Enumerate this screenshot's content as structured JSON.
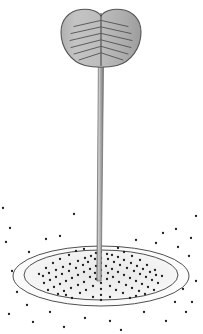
{
  "figure": {
    "canvas": {
      "width": 203,
      "height": 334,
      "background": "#ffffff"
    },
    "palette": {
      "blade_fill_light": "#c2c2c2",
      "blade_fill_dark": "#9d9d9d",
      "blade_outline": "#555555",
      "vein_color": "#4a4a4a",
      "stem_light": "#bdbdbd",
      "stem_mid": "#9a9a9a",
      "stem_dark": "#6f6f6f",
      "stem_outline": "#6a6a6a",
      "ellipse_outline": "#4f4f4f",
      "ellipse_fill_center": "#ededed",
      "ellipse_fill_edge": "#f7f7f7",
      "dot_color": "#1d1d1d"
    }
  },
  "blade": {
    "label": "cordate-leaf-blade",
    "center_x": 101,
    "center_y": 38,
    "radius_x": 40,
    "radius_y": 29,
    "notch_depth": 7,
    "outline_width": 1.1,
    "vein_count": 6,
    "vein_label": "chevron-veins"
  },
  "midrib": {
    "label": "midrib",
    "x": 101,
    "top_y": 13,
    "bottom_y": 66
  },
  "stem": {
    "label": "petiole-stem",
    "top_x": 101,
    "top_y": 60,
    "bottom_x": 99,
    "bottom_y": 281,
    "top_half_width": 2.6,
    "bottom_half_width": 2.2
  },
  "ground": {
    "outer_ellipse": {
      "label": "outer-ellipse",
      "cx": 101,
      "cy": 276,
      "rx": 88,
      "ry": 30
    },
    "inner_ellipse": {
      "label": "inner-ellipse",
      "cx": 101,
      "cy": 275,
      "rx": 77,
      "ry": 25
    },
    "outline_width": 1.0
  },
  "dots": {
    "label": "stipple-dots",
    "radius": 1.15,
    "inside": [
      [
        101,
        252
      ],
      [
        96,
        253
      ],
      [
        107,
        254
      ],
      [
        91,
        256
      ],
      [
        112,
        255
      ],
      [
        85,
        258
      ],
      [
        118,
        257
      ],
      [
        101,
        258
      ],
      [
        95,
        259
      ],
      [
        108,
        259
      ],
      [
        78,
        261
      ],
      [
        124,
        260
      ],
      [
        88,
        262
      ],
      [
        114,
        262
      ],
      [
        101,
        263
      ],
      [
        70,
        264
      ],
      [
        131,
        263
      ],
      [
        83,
        265
      ],
      [
        120,
        265
      ],
      [
        96,
        266
      ],
      [
        106,
        266
      ],
      [
        63,
        267
      ],
      [
        137,
        266
      ],
      [
        76,
        268
      ],
      [
        127,
        268
      ],
      [
        90,
        269
      ],
      [
        112,
        269
      ],
      [
        101,
        270
      ],
      [
        56,
        270
      ],
      [
        143,
        269
      ],
      [
        69,
        271
      ],
      [
        134,
        271
      ],
      [
        84,
        272
      ],
      [
        118,
        272
      ],
      [
        95,
        273
      ],
      [
        108,
        273
      ],
      [
        49,
        273
      ],
      [
        150,
        272
      ],
      [
        62,
        274
      ],
      [
        140,
        274
      ],
      [
        78,
        275
      ],
      [
        124,
        275
      ],
      [
        101,
        276
      ],
      [
        90,
        277
      ],
      [
        113,
        277
      ],
      [
        43,
        276
      ],
      [
        156,
        275
      ],
      [
        56,
        277
      ],
      [
        146,
        277
      ],
      [
        72,
        278
      ],
      [
        130,
        278
      ],
      [
        96,
        279
      ],
      [
        107,
        279
      ],
      [
        50,
        280
      ],
      [
        152,
        280
      ],
      [
        66,
        281
      ],
      [
        136,
        281
      ],
      [
        84,
        282
      ],
      [
        119,
        282
      ],
      [
        101,
        283
      ],
      [
        44,
        283
      ],
      [
        158,
        283
      ],
      [
        60,
        284
      ],
      [
        142,
        284
      ],
      [
        78,
        285
      ],
      [
        126,
        285
      ],
      [
        93,
        286
      ],
      [
        110,
        286
      ],
      [
        54,
        287
      ],
      [
        148,
        287
      ],
      [
        71,
        288
      ],
      [
        132,
        288
      ],
      [
        101,
        289
      ],
      [
        86,
        290
      ],
      [
        116,
        290
      ],
      [
        64,
        291
      ],
      [
        139,
        291
      ],
      [
        48,
        290
      ],
      [
        154,
        290
      ],
      [
        80,
        293
      ],
      [
        123,
        293
      ],
      [
        101,
        295
      ],
      [
        58,
        294
      ],
      [
        145,
        294
      ],
      [
        93,
        297
      ],
      [
        110,
        297
      ],
      [
        72,
        298
      ],
      [
        130,
        298
      ],
      [
        101,
        300
      ],
      [
        66,
        295
      ],
      [
        136,
        296
      ],
      [
        118,
        248
      ],
      [
        84,
        249
      ],
      [
        124,
        252
      ],
      [
        76,
        251
      ],
      [
        132,
        256
      ],
      [
        69,
        255
      ],
      [
        140,
        260
      ],
      [
        60,
        259
      ],
      [
        147,
        265
      ],
      [
        53,
        263
      ],
      [
        155,
        270
      ],
      [
        46,
        268
      ],
      [
        162,
        276
      ],
      [
        39,
        274
      ]
    ],
    "outside": [
      [
        74,
        214
      ],
      [
        6,
        242
      ],
      [
        176,
        229
      ],
      [
        163,
        233
      ],
      [
        189,
        256
      ],
      [
        196,
        281
      ],
      [
        192,
        302
      ],
      [
        12,
        271
      ],
      [
        9,
        314
      ],
      [
        33,
        322
      ],
      [
        64,
        327
      ],
      [
        121,
        330
      ],
      [
        166,
        321
      ],
      [
        186,
        312
      ],
      [
        196,
        216
      ],
      [
        3,
        208
      ],
      [
        46,
        239
      ],
      [
        156,
        243
      ],
      [
        29,
        252
      ],
      [
        178,
        247
      ],
      [
        100,
        239
      ],
      [
        136,
        240
      ],
      [
        60,
        236
      ],
      [
        183,
        289
      ],
      [
        17,
        292
      ],
      [
        27,
        305
      ],
      [
        175,
        302
      ],
      [
        85,
        318
      ],
      [
        144,
        312
      ],
      [
        50,
        312
      ],
      [
        110,
        321
      ],
      [
        191,
        238
      ],
      [
        10,
        228
      ]
    ]
  }
}
